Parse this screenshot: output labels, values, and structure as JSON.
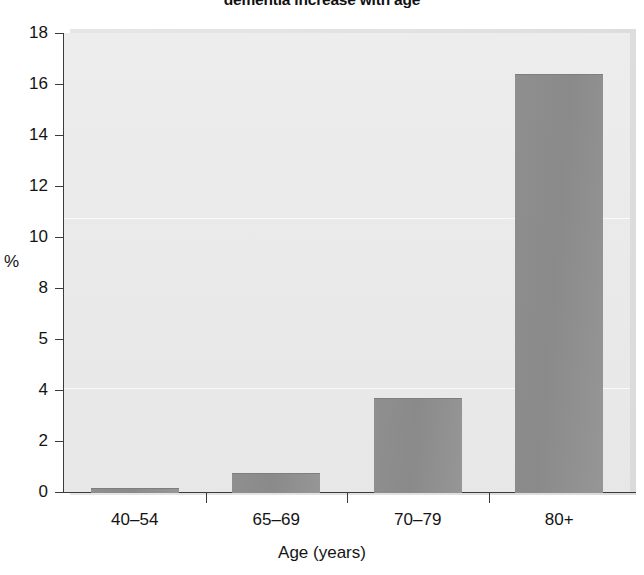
{
  "chart_data": {
    "type": "bar",
    "title": "dementia increase with age",
    "title_truncated": true,
    "xlabel": "Age (years)",
    "ylabel": "%",
    "categories": [
      "40–54",
      "65–69",
      "70–79",
      "80+"
    ],
    "values": [
      0.15,
      0.75,
      3.7,
      16.4
    ],
    "series": [
      {
        "name": "Prevalence",
        "values": [
          0.15,
          0.75,
          3.7,
          16.4
        ]
      }
    ],
    "ytick_labels": [
      "18",
      "16",
      "14",
      "12",
      "10",
      "8",
      "5",
      "4",
      "2",
      "0"
    ],
    "ytick_values": [
      18,
      16,
      14,
      12,
      10,
      8,
      6,
      4,
      2,
      0
    ],
    "ylim": [
      0,
      18
    ],
    "grid": false,
    "legend": false,
    "colors": {
      "bar": "#8a8a8a",
      "plot_background": "#eaeaea",
      "axis": "#3b3b3b",
      "text": "#141414"
    }
  }
}
